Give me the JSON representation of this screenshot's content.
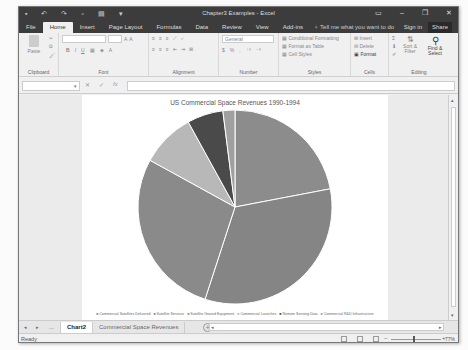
{
  "window": {
    "title": "Chapter3 Examples - Excel",
    "qat_icons": [
      "save-icon",
      "undo-icon",
      "redo-icon",
      "new-icon",
      "print-icon",
      "customize-icon"
    ],
    "controls": {
      "ribbon_display": "▭",
      "minimize": "–",
      "restore": "❐",
      "close": "✕"
    }
  },
  "tabs": [
    {
      "label": "File"
    },
    {
      "label": "Home",
      "active": true
    },
    {
      "label": "Insert"
    },
    {
      "label": "Page Layout"
    },
    {
      "label": "Formulas"
    },
    {
      "label": "Data"
    },
    {
      "label": "Review"
    },
    {
      "label": "View"
    },
    {
      "label": "Add-ins"
    }
  ],
  "tell_me": "♀ Tell me what you want to do",
  "sign_in": "Sign in",
  "share": "Share",
  "ribbon": {
    "clipboard": {
      "label": "Clipboard",
      "paste": "Paste"
    },
    "font": {
      "label": "Font",
      "font_name": "",
      "font_size": "",
      "bold": "B",
      "italic": "I",
      "underline": "U"
    },
    "alignment": {
      "label": "Alignment"
    },
    "number": {
      "label": "Number",
      "format": "General",
      "currency": "$",
      "percent": "%",
      "comma": ","
    },
    "styles": {
      "label": "Styles",
      "conditional": "Conditional Formatting",
      "format_table": "Format as Table",
      "cell_styles": "Cell Styles"
    },
    "cells": {
      "label": "Cells",
      "insert": "Insert",
      "delete": "Delete",
      "format": "Format"
    },
    "editing": {
      "label": "Editing",
      "sort_filter": "Sort & Filter",
      "find_select": "Find & Select",
      "sum": "Σ"
    }
  },
  "formula_bar": {
    "name_box": "",
    "cancel": "✕",
    "enter": "✓",
    "fx": "fx",
    "value": ""
  },
  "sheet_tabs": [
    {
      "label": "...",
      "active": false
    },
    {
      "label": "Chart2",
      "active": true
    },
    {
      "label": "Commercial Space Revenues",
      "active": false
    }
  ],
  "status": {
    "ready": "Ready",
    "zoom": "77%"
  },
  "chart_data": {
    "type": "pie",
    "title": "US Commercial Space Revenues 1990-1994",
    "categories": [
      "Commercial Satellites Delivered",
      "Satellite Services",
      "Satellite Ground Equipment",
      "Commercial Launches",
      "Remote Sensing Data",
      "Commercial R&D Infrastructure"
    ],
    "values": [
      22,
      33,
      28,
      9,
      6,
      2
    ],
    "colors": [
      "#8c8c8c",
      "#858585",
      "#8a8a8a",
      "#b8b8b8",
      "#4a4a4a",
      "#a0a0a0"
    ],
    "legend_position": "bottom"
  }
}
